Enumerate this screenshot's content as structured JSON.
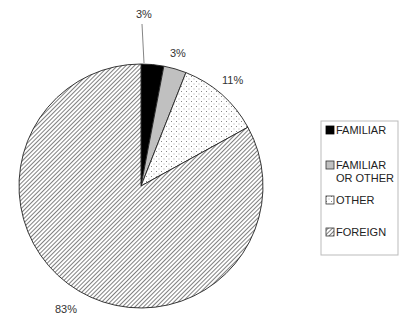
{
  "chart_data": {
    "type": "pie",
    "title": "",
    "start_angle_deg": 0,
    "direction": "clockwise",
    "slices": [
      {
        "label": "FAMILIAR",
        "value": 3,
        "display": "3%",
        "fill": "#000000",
        "pattern": "solid"
      },
      {
        "label": "FAMILIAR OR OTHER",
        "value": 3,
        "display": "3%",
        "fill": "#c0c0c0",
        "pattern": "solid"
      },
      {
        "label": "OTHER",
        "value": 11,
        "display": "11%",
        "fill": "#ffffff",
        "pattern": "dots"
      },
      {
        "label": "FOREIGN",
        "value": 83,
        "display": "83%",
        "fill": "#ffffff",
        "pattern": "diagonal-hatch"
      }
    ],
    "legend": {
      "position": "right",
      "entries": [
        {
          "lines": [
            "FAMILIAR"
          ]
        },
        {
          "lines": [
            "FAMILIAR",
            "OR OTHER"
          ]
        },
        {
          "lines": [
            "OTHER"
          ]
        },
        {
          "lines": [
            "FOREIGN"
          ]
        }
      ]
    }
  },
  "labels": {
    "familiar": "3%",
    "familiar_or_other": "3%",
    "other": "11%",
    "foreign": "83%"
  },
  "legend": {
    "familiar": "FAMILIAR",
    "familiar_or_other_1": "FAMILIAR",
    "familiar_or_other_2": "OR OTHER",
    "other": "OTHER",
    "foreign": "FOREIGN"
  }
}
